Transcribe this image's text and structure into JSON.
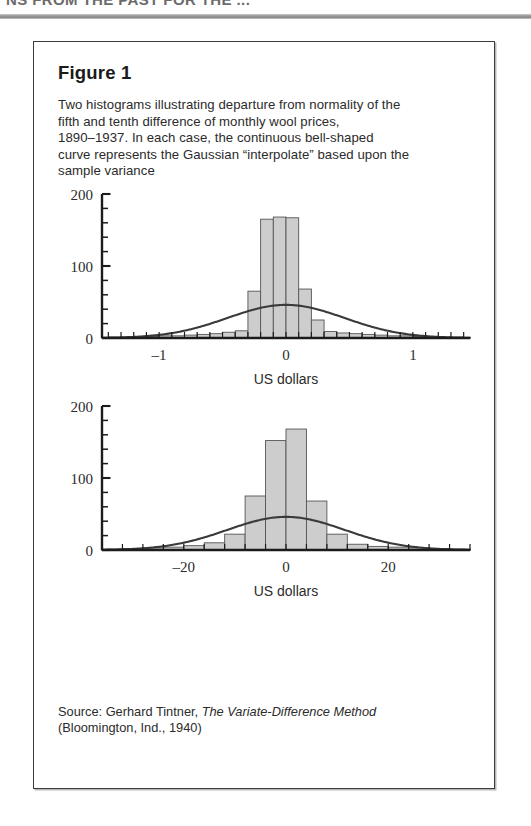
{
  "running_head": {
    "text": "NS FROM THE PAST FOR THE ..."
  },
  "figure": {
    "title": "Figure 1",
    "caption_lines": [
      "Two histograms illustrating departure from normality of the",
      "fifth and tenth difference of monthly wool prices,",
      "1890–1937. In each case, the continuous bell-shaped",
      "curve represents the Gaussian “interpolate” based upon the",
      "sample variance"
    ],
    "source_prefix": "Source: Gerhard Tintner, ",
    "source_title": "The Variate-Difference Method",
    "source_rest": "(Bloomington, Ind., 1940)"
  },
  "chart_data": [
    {
      "type": "bar",
      "title": "Fifth difference of monthly wool prices",
      "xlabel": "US dollars",
      "ylabel": "",
      "xlim": [
        -1.45,
        1.45
      ],
      "ylim": [
        0,
        200
      ],
      "xticks": [
        -1,
        0,
        1
      ],
      "xtick_labels": [
        "–1",
        "0",
        "1"
      ],
      "yticks": [
        0,
        100,
        200
      ],
      "ytick_labels": [
        "0",
        "100",
        "200"
      ],
      "yminor_step": 20,
      "grid": false,
      "legend": "none",
      "bin_width": 0.1,
      "bin_centers": [
        -1.35,
        -1.25,
        -1.15,
        -1.05,
        -0.95,
        -0.85,
        -0.75,
        -0.65,
        -0.55,
        -0.45,
        -0.35,
        -0.25,
        -0.15,
        -0.05,
        0.05,
        0.15,
        0.25,
        0.35,
        0.45,
        0.55,
        0.65,
        0.75,
        0.85,
        0.95,
        1.05,
        1.15,
        1.25,
        1.35
      ],
      "values": [
        1,
        1,
        2,
        2,
        3,
        3,
        4,
        5,
        6,
        8,
        10,
        65,
        165,
        168,
        167,
        68,
        25,
        9,
        7,
        6,
        5,
        4,
        3,
        3,
        2,
        2,
        1,
        1
      ],
      "curve": {
        "name": "Gaussian interpolate",
        "peak": 46,
        "mean": 0,
        "sigma": 0.46,
        "color": "#3a3a3a"
      },
      "bar_fill": "#cdcdcd",
      "bar_stroke": "#555555"
    },
    {
      "type": "bar",
      "title": "Tenth difference of monthly wool prices",
      "xlabel": "US dollars",
      "ylabel": "",
      "xlim": [
        -36,
        36
      ],
      "ylim": [
        0,
        200
      ],
      "xticks": [
        -20,
        0,
        20
      ],
      "xtick_labels": [
        "–20",
        "0",
        "20"
      ],
      "yticks": [
        0,
        100,
        200
      ],
      "ytick_labels": [
        "0",
        "100",
        "200"
      ],
      "yminor_step": 20,
      "grid": false,
      "legend": "none",
      "bin_width": 4,
      "bin_centers": [
        -34,
        -30,
        -26,
        -22,
        -18,
        -14,
        -10,
        -6,
        -2,
        2,
        6,
        10,
        14,
        18,
        22,
        26,
        30,
        34
      ],
      "values": [
        1,
        2,
        3,
        4,
        6,
        10,
        22,
        75,
        152,
        168,
        68,
        22,
        8,
        5,
        4,
        3,
        2,
        1
      ],
      "curve": {
        "name": "Gaussian interpolate",
        "peak": 46,
        "mean": 0,
        "sigma": 11.5,
        "color": "#3a3a3a"
      },
      "bar_fill": "#cdcdcd",
      "bar_stroke": "#555555"
    }
  ]
}
